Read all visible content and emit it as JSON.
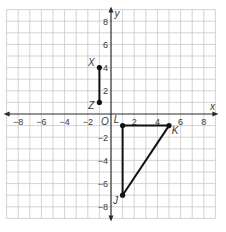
{
  "chart_data": {
    "type": "scatter",
    "title": "",
    "xlabel": "x",
    "ylabel": "y",
    "xlim": [
      -9,
      9
    ],
    "ylim": [
      -9,
      9
    ],
    "grid": true,
    "origin_label": "O",
    "x_ticks": [
      -8,
      -6,
      -4,
      -2,
      2,
      4,
      6,
      8
    ],
    "y_ticks": [
      -8,
      -6,
      -4,
      -2,
      2,
      4,
      6,
      8
    ],
    "points": [
      {
        "label": "X",
        "x": -1,
        "y": 4
      },
      {
        "label": "Z",
        "x": -1,
        "y": 1
      },
      {
        "label": "L",
        "x": 1,
        "y": -1
      },
      {
        "label": "K",
        "x": 5,
        "y": -1
      },
      {
        "label": "J",
        "x": 1,
        "y": -7
      }
    ],
    "segments": [
      {
        "from": "X",
        "to": "Z"
      },
      {
        "from": "L",
        "to": "K"
      },
      {
        "from": "K",
        "to": "J"
      },
      {
        "from": "J",
        "to": "L"
      }
    ],
    "shapes": [
      {
        "name": "segment XZ",
        "vertices": [
          "X",
          "Z"
        ]
      },
      {
        "name": "triangle JKL",
        "vertices": [
          "J",
          "K",
          "L"
        ]
      }
    ]
  },
  "colors": {
    "grid": "#c8c8c8",
    "axis": "#2a2a2a",
    "figure": "#111111",
    "text": "#3a3a3a"
  }
}
